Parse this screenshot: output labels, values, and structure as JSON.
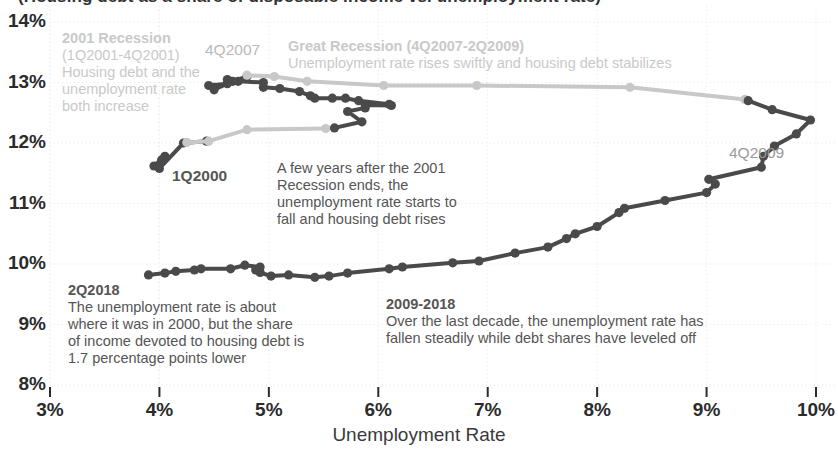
{
  "title_clipped": "(Housing debt as a share of disposable income vs. unemployment rate)",
  "axes": {
    "x_title": "Unemployment Rate",
    "x_ticks": [
      "3%",
      "4%",
      "5%",
      "6%",
      "7%",
      "8%",
      "9%",
      "10%"
    ],
    "x_values": [
      3,
      4,
      5,
      6,
      7,
      8,
      9,
      10
    ],
    "y_ticks": [
      "14%",
      "13%",
      "12%",
      "11%",
      "10%",
      "9%",
      "8%"
    ],
    "y_values": [
      14,
      13,
      12,
      11,
      10,
      9,
      8
    ],
    "xlim": [
      3,
      10
    ],
    "ylim": [
      8,
      14
    ],
    "grid": true
  },
  "colors": {
    "dark_line": "#4a4a4a",
    "light_line": "#c8c8c8",
    "grid": "#e6e6e6",
    "tick_text": "#2b2b2b",
    "annotation_dark": "#555555",
    "annotation_light": "#c9c9c9"
  },
  "annotations": [
    {
      "name": "recession-2001",
      "style": "light",
      "x": 62,
      "y": 30,
      "width": 150,
      "heading": "2001 Recession",
      "lines": [
        "(1Q2001-4Q2001)",
        "Housing debt and the",
        "unemployment rate",
        "both increase"
      ]
    },
    {
      "name": "great-recession",
      "style": "light",
      "x": 288,
      "y": 38,
      "width": 470,
      "heading": "Great Recession (4Q2007-2Q2009)",
      "lines": [
        "Unemployment rate rises swiftly and housing debt stabilizes"
      ]
    },
    {
      "name": "post-2001-note",
      "style": "dark",
      "x": 277,
      "y": 160,
      "width": 230,
      "heading": "",
      "lines": [
        "A few years after the 2001",
        "Recession ends, the",
        "unemployment rate starts to",
        "fall and housing debt rises"
      ]
    },
    {
      "name": "note-2q2018",
      "style": "dark",
      "x": 68,
      "y": 282,
      "width": 300,
      "heading": "2Q2018",
      "lines": [
        "The unemployment rate is about",
        "where it was in 2000, but the share",
        "of income devoted to housing debt is",
        "1.7 percentage points lower"
      ]
    },
    {
      "name": "note-2009-2018",
      "style": "dark",
      "x": 386,
      "y": 296,
      "width": 410,
      "heading": "2009-2018",
      "lines": [
        "Over the last decade, the unemployment rate has",
        "fallen steadily while debt shares have leveled off"
      ]
    }
  ],
  "point_labels": [
    {
      "name": "label-4q2007",
      "text": "4Q2007",
      "x": 205,
      "y": 41,
      "style": "light"
    },
    {
      "name": "label-1q2000",
      "text": "1Q2000",
      "x": 172,
      "y": 167,
      "style": "dark"
    },
    {
      "name": "label-4q2009",
      "text": "4Q2009",
      "x": 729,
      "y": 144,
      "style": "gray"
    }
  ],
  "chart_data": {
    "type": "line",
    "xlabel": "Unemployment Rate",
    "ylabel": "Housing debt as share of disposable income",
    "xlim": [
      3,
      10
    ],
    "ylim": [
      8,
      14
    ],
    "grid": true,
    "legend": "none",
    "note": "Connected scatter (phase diagram) traced quarterly 1Q2000 through 2Q2018. Light gray segments mark recession periods (2001 Recession and Great Recession); dark gray segments mark expansions.",
    "series": [
      {
        "name": "expansion-2000-2001",
        "color": "#4a4a4a",
        "points": [
          {
            "label": "1Q2000",
            "x": 4.05,
            "y": 11.78
          },
          {
            "label": "2Q2000",
            "x": 3.95,
            "y": 11.62
          },
          {
            "label": "3Q2000",
            "x": 4.02,
            "y": 11.72
          },
          {
            "label": "4Q2000",
            "x": 4.0,
            "y": 11.58
          },
          {
            "label": "1Q2001",
            "x": 4.22,
            "y": 12.0
          },
          {
            "label": "2Q2001",
            "x": 4.43,
            "y": 12.03
          }
        ]
      },
      {
        "name": "recession-2001",
        "color": "#c8c8c8",
        "points": [
          {
            "label": "1Q2001",
            "x": 4.25,
            "y": 12.01
          },
          {
            "label": "2Q2001",
            "x": 4.45,
            "y": 12.03
          },
          {
            "label": "3Q2001",
            "x": 4.8,
            "y": 12.22
          },
          {
            "label": "4Q2001",
            "x": 5.52,
            "y": 12.24
          }
        ]
      },
      {
        "name": "expansion-2002-2007",
        "color": "#4a4a4a",
        "points": [
          {
            "label": "1Q2002",
            "x": 5.6,
            "y": 12.25
          },
          {
            "label": "2Q2002",
            "x": 5.85,
            "y": 12.35
          },
          {
            "label": "3Q2002",
            "x": 5.72,
            "y": 12.52
          },
          {
            "label": "4Q2002",
            "x": 5.88,
            "y": 12.58
          },
          {
            "label": "1Q2003",
            "x": 5.88,
            "y": 12.63
          },
          {
            "label": "2Q2003",
            "x": 6.12,
            "y": 12.62
          },
          {
            "label": "3Q2003",
            "x": 6.1,
            "y": 12.64
          },
          {
            "label": "4Q2003",
            "x": 5.82,
            "y": 12.7
          },
          {
            "label": "1Q2004",
            "x": 5.7,
            "y": 12.74
          },
          {
            "label": "2Q2004",
            "x": 5.58,
            "y": 12.74
          },
          {
            "label": "3Q2004",
            "x": 5.42,
            "y": 12.74
          },
          {
            "label": "4Q2004",
            "x": 5.38,
            "y": 12.78
          },
          {
            "label": "1Q2005",
            "x": 5.28,
            "y": 12.85
          },
          {
            "label": "2Q2005",
            "x": 5.1,
            "y": 12.9
          },
          {
            "label": "3Q2005",
            "x": 4.95,
            "y": 12.92
          },
          {
            "label": "4Q2005",
            "x": 4.95,
            "y": 13.0
          },
          {
            "label": "1Q2006",
            "x": 4.72,
            "y": 13.02
          },
          {
            "label": "2Q2006",
            "x": 4.62,
            "y": 13.05
          },
          {
            "label": "3Q2006",
            "x": 4.62,
            "y": 12.98
          },
          {
            "label": "4Q2006",
            "x": 4.45,
            "y": 12.95
          },
          {
            "label": "1Q2007",
            "x": 4.5,
            "y": 12.92
          },
          {
            "label": "2Q2007",
            "x": 4.5,
            "y": 12.88
          },
          {
            "label": "3Q2007",
            "x": 4.67,
            "y": 13.02
          },
          {
            "label": "4Q2007",
            "x": 4.8,
            "y": 13.1
          }
        ]
      },
      {
        "name": "great-recession",
        "color": "#c8c8c8",
        "points": [
          {
            "label": "4Q2007",
            "x": 4.8,
            "y": 13.12
          },
          {
            "label": "1Q2008",
            "x": 5.05,
            "y": 13.1
          },
          {
            "label": "2Q2008",
            "x": 5.35,
            "y": 13.02
          },
          {
            "label": "3Q2008",
            "x": 6.05,
            "y": 12.95
          },
          {
            "label": "4Q2008",
            "x": 6.9,
            "y": 12.95
          },
          {
            "label": "1Q2009",
            "x": 8.3,
            "y": 12.92
          },
          {
            "label": "2Q2009",
            "x": 9.35,
            "y": 12.72
          }
        ]
      },
      {
        "name": "expansion-2009-2018",
        "color": "#4a4a4a",
        "points": [
          {
            "label": "2Q2009",
            "x": 9.38,
            "y": 12.7
          },
          {
            "label": "3Q2009",
            "x": 9.6,
            "y": 12.55
          },
          {
            "label": "4Q2009",
            "x": 9.95,
            "y": 12.38
          },
          {
            "label": "1Q2010",
            "x": 9.82,
            "y": 12.15
          },
          {
            "label": "2Q2010",
            "x": 9.62,
            "y": 11.95
          },
          {
            "label": "3Q2010",
            "x": 9.52,
            "y": 11.78
          },
          {
            "label": "4Q2010",
            "x": 9.5,
            "y": 11.6
          },
          {
            "label": "1Q2011",
            "x": 9.02,
            "y": 11.4
          },
          {
            "label": "2Q2011",
            "x": 9.08,
            "y": 11.32
          },
          {
            "label": "3Q2011",
            "x": 9.0,
            "y": 11.18
          },
          {
            "label": "4Q2011",
            "x": 8.62,
            "y": 11.05
          },
          {
            "label": "1Q2012",
            "x": 8.25,
            "y": 10.92
          },
          {
            "label": "2Q2012",
            "x": 8.2,
            "y": 10.85
          },
          {
            "label": "3Q2012",
            "x": 8.0,
            "y": 10.62
          },
          {
            "label": "4Q2012",
            "x": 7.8,
            "y": 10.5
          },
          {
            "label": "1Q2013",
            "x": 7.72,
            "y": 10.42
          },
          {
            "label": "2Q2013",
            "x": 7.55,
            "y": 10.28
          },
          {
            "label": "3Q2013",
            "x": 7.25,
            "y": 10.18
          },
          {
            "label": "4Q2013",
            "x": 6.92,
            "y": 10.05
          },
          {
            "label": "1Q2014",
            "x": 6.68,
            "y": 10.02
          },
          {
            "label": "2Q2014",
            "x": 6.22,
            "y": 9.95
          },
          {
            "label": "3Q2014",
            "x": 6.1,
            "y": 9.92
          },
          {
            "label": "4Q2014",
            "x": 5.72,
            "y": 9.85
          },
          {
            "label": "1Q2015",
            "x": 5.55,
            "y": 9.8
          },
          {
            "label": "2Q2015",
            "x": 5.42,
            "y": 9.78
          },
          {
            "label": "3Q2015",
            "x": 5.18,
            "y": 9.82
          },
          {
            "label": "4Q2015",
            "x": 5.02,
            "y": 9.8
          },
          {
            "label": "1Q2016",
            "x": 4.92,
            "y": 9.86
          },
          {
            "label": "2Q2016",
            "x": 4.88,
            "y": 9.9
          },
          {
            "label": "3Q2016",
            "x": 4.92,
            "y": 9.95
          },
          {
            "label": "4Q2016",
            "x": 4.78,
            "y": 9.98
          },
          {
            "label": "1Q2017",
            "x": 4.65,
            "y": 9.92
          },
          {
            "label": "2Q2017",
            "x": 4.38,
            "y": 9.92
          },
          {
            "label": "3Q2017",
            "x": 4.32,
            "y": 9.9
          },
          {
            "label": "4Q2017",
            "x": 4.15,
            "y": 9.88
          },
          {
            "label": "1Q2018",
            "x": 4.05,
            "y": 9.85
          },
          {
            "label": "2Q2018",
            "x": 3.9,
            "y": 9.82
          }
        ]
      }
    ]
  }
}
